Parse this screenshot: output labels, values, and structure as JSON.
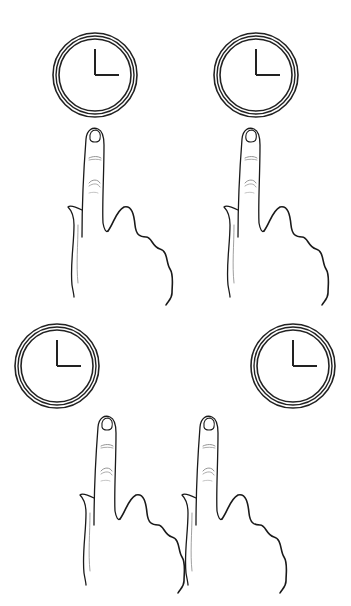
{
  "illustration": {
    "description": "Four clocks each paired with a pointing index-finger hand",
    "colors": {
      "background": "#ffffff",
      "stroke": "#1a1a1a",
      "light_stroke": "#7a7a7a"
    },
    "clocks": [
      {
        "id": "top-left",
        "cx": 95,
        "cy": 75,
        "r": 42,
        "time": "3:00"
      },
      {
        "id": "top-right",
        "cx": 256,
        "cy": 75,
        "r": 42,
        "time": "3:00"
      },
      {
        "id": "bottom-left",
        "cx": 57,
        "cy": 366,
        "r": 43,
        "time": "3:00"
      },
      {
        "id": "bottom-right",
        "cx": 293,
        "cy": 366,
        "r": 43,
        "time": "3:00"
      }
    ],
    "hands": [
      {
        "id": "top-left",
        "x": 68,
        "y": 125,
        "scale": 1
      },
      {
        "id": "top-right",
        "x": 224,
        "y": 125,
        "scale": 1
      },
      {
        "id": "bottom-left",
        "x": 80,
        "y": 413,
        "scale": 1
      },
      {
        "id": "bottom-right",
        "x": 182,
        "y": 413,
        "scale": 1
      }
    ]
  }
}
